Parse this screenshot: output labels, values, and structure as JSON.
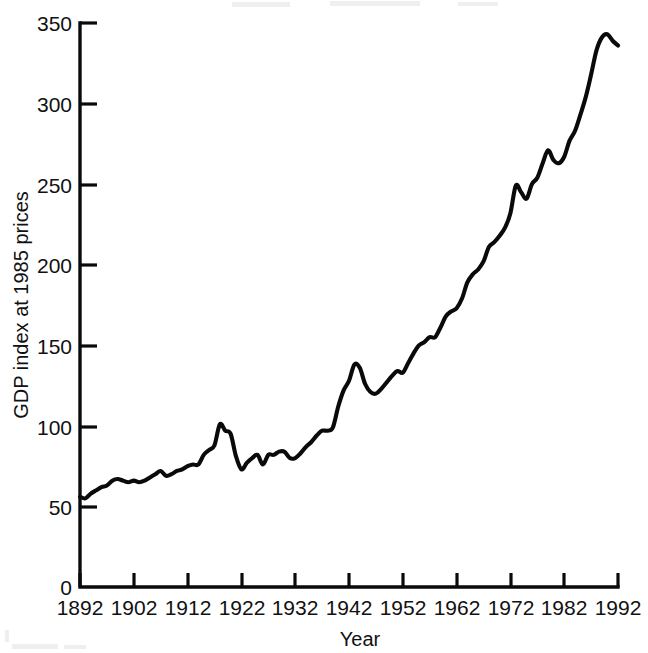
{
  "chart_data": {
    "type": "line",
    "title": "",
    "xlabel": "Year",
    "ylabel": "GDP index at 1985 prices",
    "xlim": [
      1892,
      1992
    ],
    "ylim": [
      0,
      350
    ],
    "grid": false,
    "legend": "none",
    "xticks": [
      "1892",
      "1902",
      "1912",
      "1922",
      "1932",
      "1942",
      "1952",
      "1962",
      "1972",
      "1982",
      "1992"
    ],
    "xtick_values": [
      1892,
      1902,
      1912,
      1922,
      1932,
      1942,
      1952,
      1962,
      1972,
      1982,
      1992
    ],
    "yticks": [
      "0",
      "50",
      "100",
      "150",
      "200",
      "250",
      "300",
      "350"
    ],
    "ytick_values": [
      0,
      50,
      100,
      150,
      200,
      250,
      300,
      350
    ],
    "series": [
      {
        "name": "GDP index at 1985 prices",
        "color": "#0a0a0a",
        "x": [
          1892,
          1893,
          1894,
          1895,
          1896,
          1897,
          1898,
          1899,
          1900,
          1901,
          1902,
          1903,
          1904,
          1905,
          1906,
          1907,
          1908,
          1909,
          1910,
          1911,
          1912,
          1913,
          1914,
          1915,
          1916,
          1917,
          1918,
          1919,
          1920,
          1921,
          1922,
          1923,
          1924,
          1925,
          1926,
          1927,
          1928,
          1929,
          1930,
          1931,
          1932,
          1933,
          1934,
          1935,
          1936,
          1937,
          1938,
          1939,
          1940,
          1941,
          1942,
          1943,
          1944,
          1945,
          1946,
          1947,
          1948,
          1949,
          1950,
          1951,
          1952,
          1953,
          1954,
          1955,
          1956,
          1957,
          1958,
          1959,
          1960,
          1961,
          1962,
          1963,
          1964,
          1965,
          1966,
          1967,
          1968,
          1969,
          1970,
          1971,
          1972,
          1973,
          1974,
          1975,
          1976,
          1977,
          1978,
          1979,
          1980,
          1981,
          1982,
          1983,
          1984,
          1985,
          1986,
          1987,
          1988,
          1989,
          1990,
          1991,
          1992
        ],
        "y": [
          56,
          55,
          58,
          60,
          62,
          63,
          66,
          67,
          66,
          65,
          66,
          65,
          66,
          68,
          70,
          72,
          69,
          70,
          72,
          73,
          75,
          76,
          76,
          82,
          85,
          88,
          101,
          97,
          95,
          81,
          73,
          77,
          80,
          82,
          76,
          82,
          82,
          84,
          84,
          80,
          80,
          83,
          87,
          90,
          94,
          97,
          97,
          99,
          112,
          122,
          128,
          138,
          136,
          126,
          121,
          120,
          123,
          127,
          131,
          134,
          133,
          139,
          145,
          150,
          152,
          155,
          155,
          161,
          168,
          171,
          173,
          179,
          189,
          194,
          197,
          202,
          211,
          214,
          218,
          223,
          232,
          249,
          245,
          241,
          250,
          254,
          263,
          271,
          265,
          263,
          267,
          277,
          283,
          293,
          304,
          318,
          333,
          341,
          343,
          339,
          336
        ]
      }
    ],
    "annotations": []
  },
  "axes": {
    "y_axis_title": "GDP index at 1985 prices",
    "x_axis_title": "Year"
  }
}
